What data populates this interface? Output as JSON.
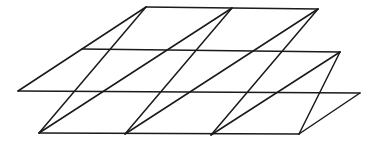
{
  "figure": {
    "background_color": "#ffffff",
    "line_color": "#1a1a1a",
    "line_width": 1.5,
    "canvas": {
      "width": 375,
      "height": 147
    }
  },
  "chart_data": {
    "type": "diagram",
    "subtype": "triangular-mesh",
    "grid": true,
    "legend": "none",
    "xlabel": "",
    "ylabel": "",
    "xlim": [
      0,
      375
    ],
    "ylim": [
      0,
      147
    ],
    "lattice": {
      "origin": [
        146,
        7
      ],
      "vector_u": [
        86,
        1
      ],
      "vector_v": [
        -64,
        42
      ],
      "columns": 4,
      "rows": 3,
      "diagonal_direction": "bottom-left-to-top-right",
      "cell_count": 12,
      "triangle_count": 24,
      "vertex_count": 20
    },
    "vertices": [
      {
        "id": "v0_0",
        "i": 0,
        "j": 0,
        "x": 146,
        "y": 7
      },
      {
        "id": "v1_0",
        "i": 1,
        "j": 0,
        "x": 232,
        "y": 8
      },
      {
        "id": "v2_0",
        "i": 2,
        "j": 0,
        "x": 318,
        "y": 9
      },
      {
        "id": "v0_1",
        "i": 0,
        "j": 1,
        "x": 82,
        "y": 49
      },
      {
        "id": "v1_1",
        "i": 1,
        "j": 1,
        "x": 168,
        "y": 50
      },
      {
        "id": "v2_1",
        "i": 2,
        "j": 1,
        "x": 254,
        "y": 51
      },
      {
        "id": "v3_1",
        "i": 3,
        "j": 1,
        "x": 340,
        "y": 52
      },
      {
        "id": "v0_2",
        "i": 0,
        "j": 2,
        "x": 18,
        "y": 91
      },
      {
        "id": "v1_2",
        "i": 1,
        "j": 2,
        "x": 104,
        "y": 92
      },
      {
        "id": "v2_2",
        "i": 2,
        "j": 2,
        "x": 190,
        "y": 93
      },
      {
        "id": "v3_2",
        "i": 3,
        "j": 2,
        "x": 276,
        "y": 94
      },
      {
        "id": "v4_2",
        "i": 4,
        "j": 2,
        "x": 360,
        "y": 93
      },
      {
        "id": "v1_3",
        "i": 1,
        "j": 3,
        "x": 39,
        "y": 133
      },
      {
        "id": "v2_3",
        "i": 2,
        "j": 3,
        "x": 125,
        "y": 134
      },
      {
        "id": "v3_3",
        "i": 3,
        "j": 3,
        "x": 211,
        "y": 135
      },
      {
        "id": "v4_3",
        "i": 4,
        "j": 3,
        "x": 299,
        "y": 134
      }
    ],
    "edges": [
      {
        "name": "row-line-top",
        "kind": "horizontal",
        "from": [
          146,
          7
        ],
        "to": [
          318,
          9
        ]
      },
      {
        "name": "row-line-upper",
        "kind": "horizontal",
        "from": [
          82,
          49
        ],
        "to": [
          340,
          52
        ]
      },
      {
        "name": "row-line-middle",
        "kind": "horizontal",
        "from": [
          18,
          91
        ],
        "to": [
          360,
          93
        ]
      },
      {
        "name": "row-line-bottom",
        "kind": "horizontal",
        "from": [
          39,
          133
        ],
        "to": [
          299,
          134
        ]
      },
      {
        "name": "skew-line-0",
        "kind": "skew",
        "from": [
          146,
          7
        ],
        "to": [
          18,
          91
        ]
      },
      {
        "name": "skew-line-1",
        "kind": "skew",
        "from": [
          232,
          8
        ],
        "to": [
          39,
          133
        ]
      },
      {
        "name": "skew-line-2",
        "kind": "skew",
        "from": [
          318,
          9
        ],
        "to": [
          125,
          134
        ]
      },
      {
        "name": "skew-line-3",
        "kind": "skew",
        "from": [
          340,
          52
        ],
        "to": [
          211,
          135
        ]
      },
      {
        "name": "skew-line-4",
        "kind": "skew",
        "from": [
          360,
          93
        ],
        "to": [
          299,
          134
        ]
      },
      {
        "name": "diag-line-0",
        "kind": "diagonal",
        "from": [
          39,
          133
        ],
        "to": [
          146,
          7
        ]
      },
      {
        "name": "diag-line-1",
        "kind": "diagonal",
        "from": [
          125,
          134
        ],
        "to": [
          232,
          8
        ]
      },
      {
        "name": "diag-line-2",
        "kind": "diagonal",
        "from": [
          211,
          135
        ],
        "to": [
          318,
          9
        ]
      },
      {
        "name": "diag-line-3",
        "kind": "diagonal",
        "from": [
          299,
          134
        ],
        "to": [
          340,
          52
        ]
      }
    ]
  }
}
